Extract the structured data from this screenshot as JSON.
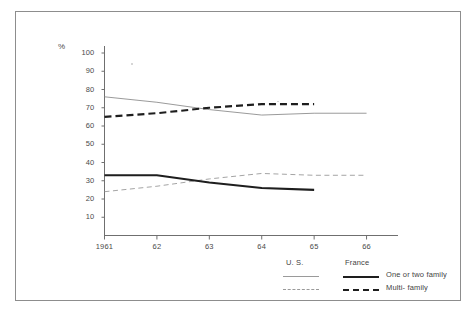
{
  "figure": {
    "percent_symbol": "%",
    "border_color": "#8d8d8d"
  },
  "legend": {
    "header_us": "U. S.",
    "header_france": "France",
    "rows": [
      {
        "label": "One or two family",
        "style": "solid"
      },
      {
        "label": "Multi- family",
        "style": "dashed"
      }
    ]
  },
  "chart_data": {
    "type": "line",
    "title": "",
    "subtitle": "",
    "xlabel": "",
    "ylabel": "%",
    "x": [
      1961,
      1962,
      1963,
      1964,
      1965,
      1966
    ],
    "xtick_labels": [
      "1961",
      "62",
      "63",
      "64",
      "65",
      "66"
    ],
    "ytick_labels": [
      "10",
      "20",
      "30",
      "40",
      "50",
      "60",
      "70",
      "80",
      "90",
      "100"
    ],
    "ytick_values": [
      10,
      20,
      30,
      40,
      50,
      60,
      70,
      80,
      90,
      100
    ],
    "ylim": [
      0,
      100
    ],
    "xlim": [
      1961,
      1966.6
    ],
    "grid": false,
    "legend_position": "bottom-right",
    "series": [
      {
        "name": "U.S. One or two family",
        "country": "U. S.",
        "category": "One or two family",
        "style": "thin-solid",
        "color": "#8f8f8f",
        "x": [
          1961,
          1962,
          1963,
          1964,
          1965,
          1966
        ],
        "values": [
          76,
          73,
          69,
          66,
          67,
          67
        ]
      },
      {
        "name": "U.S. Multi-family",
        "country": "U. S.",
        "category": "Multi- family",
        "style": "thin-dashed",
        "color": "#9a9a9a",
        "x": [
          1961,
          1962,
          1963,
          1964,
          1965,
          1966
        ],
        "values": [
          24,
          27,
          31,
          34,
          33,
          33
        ]
      },
      {
        "name": "France One or two family",
        "country": "France",
        "category": "One or two family",
        "style": "thick-solid",
        "color": "#1e1e1e",
        "x": [
          1961,
          1962,
          1963,
          1964,
          1965
        ],
        "values": [
          33,
          33,
          29,
          26,
          25
        ]
      },
      {
        "name": "France Multi-family",
        "country": "France",
        "category": "Multi- family",
        "style": "thick-dashed",
        "color": "#1e1e1e",
        "x": [
          1961,
          1962,
          1963,
          1964,
          1965
        ],
        "values": [
          65,
          67,
          70,
          72,
          72
        ]
      }
    ]
  }
}
